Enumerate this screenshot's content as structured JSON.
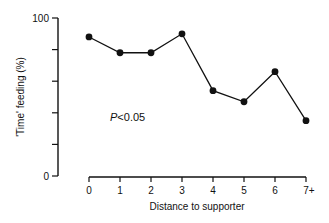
{
  "chart_data": {
    "type": "line",
    "title": "",
    "xlabel": "Distance to supporter",
    "ylabel": "'Time' feeding (%)",
    "categories": [
      "0",
      "1",
      "2",
      "3",
      "4",
      "5",
      "6",
      "7+"
    ],
    "values": [
      88,
      78,
      78,
      90,
      54,
      47,
      66,
      35
    ],
    "ylim": [
      0,
      100
    ],
    "y_ticks": [
      0,
      20,
      40,
      60,
      80,
      100
    ],
    "y_tick_labels": [
      "0",
      "",
      "",
      "",
      "",
      "100"
    ],
    "grid": false,
    "legend": null,
    "annotations": [
      {
        "text_italic": "P",
        "text": "<0.05"
      }
    ],
    "marker": "filled-circle",
    "line_color": "#111111"
  },
  "labels": {
    "ylabel": "'Time' feeding (%)",
    "xlabel": "Distance to supporter",
    "annotation_p": "P",
    "annotation_rest": "<0.05"
  }
}
